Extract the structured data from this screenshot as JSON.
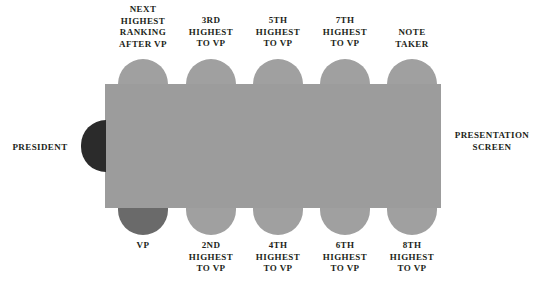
{
  "diagram": {
    "colors": {
      "table": "#9c9c9c",
      "chair": "#a0a0a0",
      "president_chair": "#2b2b2b",
      "vp_chair": "#6a6a6a",
      "background": "#ffffff",
      "text": "#231f20"
    },
    "table": {
      "name": "conference-table"
    },
    "president": {
      "label": "PRESIDENT",
      "chair_name": "president-chair"
    },
    "presentation_screen": {
      "label": "PRESENTATION\nSCREEN"
    },
    "top_seats": [
      {
        "label": "NEXT\nHIGHEST\nRANKING\nAFTER VP",
        "name": "seat-next-highest-after-vp"
      },
      {
        "label": "3RD\nHIGHEST\nTO VP",
        "name": "seat-3rd-highest"
      },
      {
        "label": "5TH\nHIGHEST\nTO VP",
        "name": "seat-5th-highest"
      },
      {
        "label": "7TH\nHIGHEST\nTO VP",
        "name": "seat-7th-highest"
      },
      {
        "label": "NOTE\nTAKER",
        "name": "seat-note-taker"
      }
    ],
    "bottom_seats": [
      {
        "label": "VP",
        "name": "seat-vp"
      },
      {
        "label": "2ND\nHIGHEST\nTO VP",
        "name": "seat-2nd-highest"
      },
      {
        "label": "4TH\nHIGHEST\nTO VP",
        "name": "seat-4th-highest"
      },
      {
        "label": "6TH\nHIGHEST\nTO VP",
        "name": "seat-6th-highest"
      },
      {
        "label": "8TH\nHIGHEST\nTO VP",
        "name": "seat-8th-highest"
      }
    ]
  }
}
